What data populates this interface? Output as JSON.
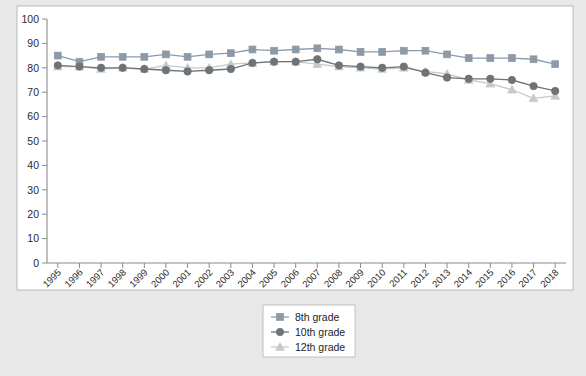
{
  "chart_data": {
    "type": "line",
    "title": "",
    "subtitle": "",
    "xlabel": "",
    "ylabel": "",
    "categories": [
      "1995",
      "1996",
      "1997",
      "1998",
      "1999",
      "2000",
      "2001",
      "2002",
      "2003",
      "2004",
      "2005",
      "2006",
      "2007",
      "2008",
      "2009",
      "2010",
      "2011",
      "2012",
      "2013",
      "2014",
      "2015",
      "2016",
      "2017",
      "2018"
    ],
    "ylim": [
      0,
      100
    ],
    "ytick_values": [
      0,
      10,
      20,
      30,
      40,
      50,
      60,
      70,
      80,
      90,
      100
    ],
    "ytick_labels": [
      "0",
      "10",
      "20",
      "30",
      "40",
      "50",
      "60",
      "70",
      "80",
      "90",
      "100"
    ],
    "grid": false,
    "legend_position": "bottom-center",
    "series": [
      {
        "name": "8th grade",
        "marker": "square",
        "color": "#8c9aa8",
        "values": [
          85,
          82.5,
          84.5,
          84.5,
          84.5,
          85.5,
          84.5,
          85.5,
          86,
          87.5,
          87,
          87.5,
          88,
          87.5,
          86.5,
          86.5,
          87,
          87,
          85.5,
          84,
          84,
          84,
          83.5,
          81.5
        ]
      },
      {
        "name": "10th grade",
        "marker": "circle",
        "color": "#6e7378",
        "values": [
          81,
          80.5,
          80,
          80,
          79.5,
          79,
          78.5,
          79,
          79.5,
          82,
          82.5,
          82.5,
          83.5,
          81,
          80.5,
          80,
          80.5,
          78,
          76,
          75.5,
          75.5,
          75,
          72.5,
          70.5
        ]
      },
      {
        "name": "12th grade",
        "marker": "triangle",
        "color": "#c3c9cc",
        "values": [
          80.5,
          80.5,
          79.5,
          80,
          79.5,
          81,
          80,
          80,
          81.5,
          82,
          82.5,
          82.5,
          81.5,
          80.5,
          80,
          79.5,
          80,
          78.5,
          77.5,
          75,
          73.5,
          71,
          67.5,
          68.5
        ]
      }
    ]
  },
  "legend": {
    "items": [
      {
        "label": "8th grade"
      },
      {
        "label": "10th grade"
      },
      {
        "label": "12th grade"
      }
    ]
  },
  "caption": {
    "text": ""
  }
}
